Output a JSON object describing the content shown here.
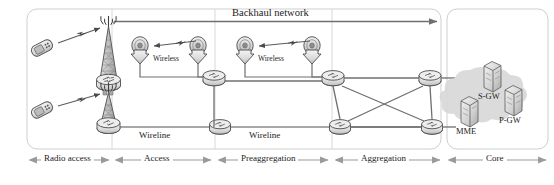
{
  "figure": {
    "background": "#ffffff",
    "width": 554,
    "height": 185
  },
  "colors": {
    "line": "#6f6f6f",
    "line_dark": "#4a4a4a",
    "box_border": "#c9c9c9",
    "cloud_fill": "#d9d9d9",
    "node_fill": "#e8e8e8",
    "node_stroke": "#555555",
    "text": "#1c1c1c",
    "arrow": "#8a8a8a"
  },
  "annotations": {
    "backhaul_label": "Backhaul network",
    "wireless_label_1": "Wireless",
    "wireless_label_2": "Wireless",
    "wireline_label_1": "Wireline",
    "wireline_label_2": "Wireline"
  },
  "sections": [
    {
      "id": "radio-access",
      "label": "Radio access",
      "x_start": 28,
      "x_end": 110
    },
    {
      "id": "access",
      "label": "Access",
      "x_start": 114,
      "x_end": 213
    },
    {
      "id": "preaggregation",
      "label": "Preaggregation",
      "x_start": 217,
      "x_end": 330
    },
    {
      "id": "aggregation",
      "label": "Aggregation",
      "x_start": 334,
      "x_end": 443
    },
    {
      "id": "core",
      "label": "Core",
      "x_start": 447,
      "x_end": 548
    }
  ],
  "core_nodes": [
    {
      "id": "s-gw",
      "label": "S-GW"
    },
    {
      "id": "mme",
      "label": "MME"
    },
    {
      "id": "p-gw",
      "label": "P-GW"
    }
  ],
  "devices": {
    "mobile_phones": 2,
    "cell_towers": 2,
    "microwave_antennas": 4,
    "routers": 7
  }
}
